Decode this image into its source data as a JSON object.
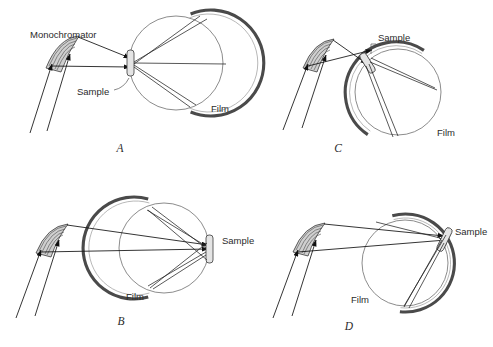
{
  "figure": {
    "background_color": "#ffffff",
    "ink_color": "#111111",
    "film_color": "#4a4a4a",
    "circle_color": "#6f6f6f",
    "component_fill": "#cfcfcf"
  },
  "panels": [
    {
      "id": "A",
      "letter": "A",
      "letter_pos": {
        "x": 120,
        "y": 152
      },
      "labels": [
        {
          "name": "monochromator",
          "text": "Monochromator",
          "x": 30,
          "y": 38,
          "anchor": "start"
        },
        {
          "name": "sample",
          "text": "Sample",
          "x": 77,
          "y": 95,
          "anchor": "start"
        },
        {
          "name": "film",
          "text": "Film",
          "x": 211,
          "y": 112,
          "anchor": "start"
        }
      ],
      "circle": {
        "cx": 176,
        "cy": 63,
        "r": 47
      },
      "film_arc": {
        "start_deg": -72,
        "end_deg": 72,
        "radius": 53
      },
      "monochromator": {
        "x": 50,
        "y": 48,
        "rotation": -30
      },
      "sample": {
        "x": 131,
        "y": 63,
        "rotation": 0
      }
    },
    {
      "id": "B",
      "letter": "B",
      "letter_pos": {
        "x": 121,
        "y": 325
      },
      "labels": [
        {
          "name": "sample",
          "text": "Sample",
          "x": 222,
          "y": 244,
          "anchor": "start"
        },
        {
          "name": "film",
          "text": "Film",
          "x": 126,
          "y": 300,
          "anchor": "start"
        }
      ],
      "circle": {
        "cx": 164,
        "cy": 248,
        "r": 45
      },
      "film_arc": {
        "start_deg": 108,
        "end_deg": 252,
        "radius": 51
      },
      "monochromator": {
        "x": 40,
        "y": 233,
        "rotation": -30
      },
      "sample": {
        "x": 210,
        "y": 250,
        "rotation": 0
      }
    },
    {
      "id": "C",
      "letter": "C",
      "letter_pos": {
        "x": 338,
        "y": 152
      },
      "labels": [
        {
          "name": "sample",
          "text": "Sample",
          "x": 378,
          "y": 41,
          "anchor": "start"
        },
        {
          "name": "film",
          "text": "Film",
          "x": 437,
          "y": 136,
          "anchor": "start"
        }
      ],
      "circle": {
        "cx": 398,
        "cy": 92,
        "r": 43
      },
      "film_arc": {
        "start_deg": -58,
        "end_deg": 128,
        "radius": 49
      },
      "monochromator": {
        "x": 306,
        "y": 48,
        "rotation": -28
      },
      "sample": {
        "x": 370,
        "y": 62,
        "rotation": -35
      }
    },
    {
      "id": "D",
      "letter": "D",
      "letter_pos": {
        "x": 349,
        "y": 330
      },
      "labels": [
        {
          "name": "sample",
          "text": "Sample",
          "x": 455,
          "y": 235,
          "anchor": "start"
        },
        {
          "name": "film",
          "text": "Film",
          "x": 351,
          "y": 303,
          "anchor": "start"
        }
      ],
      "circle": {
        "cx": 405,
        "cy": 263,
        "r": 43
      },
      "film_arc": {
        "start_deg": 96,
        "end_deg": 285,
        "radius": 49
      },
      "monochromator": {
        "x": 296,
        "y": 232,
        "rotation": -30
      },
      "sample": {
        "x": 447,
        "y": 238,
        "rotation": 28
      }
    }
  ],
  "legend_terms": {
    "monochromator": "Monochromator",
    "sample": "Sample",
    "film": "Film"
  }
}
